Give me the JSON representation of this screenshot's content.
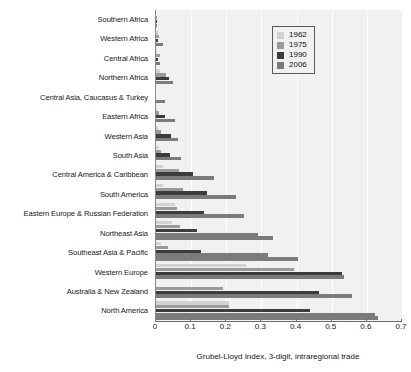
{
  "chart_data": {
    "type": "bar",
    "orientation": "horizontal",
    "title": "",
    "xlabel": "Grubel-Lloyd Index, 3-digit, intraregional trade",
    "ylabel": "",
    "xlim": [
      0,
      0.7
    ],
    "xticks": [
      0,
      0.1,
      0.2,
      0.3,
      0.4,
      0.5,
      0.6,
      0.7
    ],
    "xtick_labels": [
      "0",
      "0.1",
      "0.2",
      "0.3",
      "0.4",
      "0.5",
      "0.6",
      "0.7"
    ],
    "grid": true,
    "grid_axis": "x",
    "legend_position": "top-right",
    "categories": [
      "Southern Africa",
      "Western Africa",
      "Central Africa",
      "Northern Africa",
      "Central Asia, Caucasus & Turkey",
      "Eastern Africa",
      "Western Asia",
      "South Asia",
      "Central America & Caribbean",
      "South America",
      "Eastern Europe & Russian Federation",
      "Northeast Asia",
      "Southeast Asia & Pacific",
      "Western Europe",
      "Australia & New Zealand",
      "North America"
    ],
    "series": [
      {
        "name": "1962",
        "color": "#d2d2d2",
        "values": [
          0.0,
          0.007,
          0.004,
          0.012,
          0.0,
          0.002,
          0.006,
          0.008,
          0.021,
          0.02,
          0.055,
          0.045,
          0.015,
          0.256,
          0.0,
          0.208
        ]
      },
      {
        "name": "1975",
        "color": "#9a9a9a",
        "values": [
          0.002,
          0.009,
          0.01,
          0.028,
          0.0,
          0.008,
          0.013,
          0.014,
          0.065,
          0.077,
          0.06,
          0.068,
          0.033,
          0.392,
          0.19,
          0.207
        ]
      },
      {
        "name": "1990",
        "color": "#3c3c3c",
        "values": [
          0.002,
          0.005,
          0.005,
          0.037,
          0.0,
          0.025,
          0.042,
          0.04,
          0.105,
          0.145,
          0.137,
          0.116,
          0.128,
          0.529,
          0.463,
          0.438
        ]
      },
      {
        "name": "2006",
        "color": "#7b7b7b",
        "values": [
          0.002,
          0.021,
          0.012,
          0.049,
          0.026,
          0.053,
          0.062,
          0.072,
          0.165,
          0.227,
          0.249,
          0.29,
          0.318,
          0.536,
          0.558,
          0.622
        ]
      }
    ],
    "extra_bars": [
      {
        "category": "Northeast Asia",
        "series": "2006b",
        "value": 0.334,
        "color": "#7b7b7b"
      },
      {
        "category": "Southeast Asia & Pacific",
        "series": "2006b",
        "value": 0.404,
        "color": "#7b7b7b"
      },
      {
        "category": "North America",
        "series": "2006b",
        "value": 0.632,
        "color": "#7b7b7b"
      }
    ]
  },
  "legend": {
    "items": [
      {
        "label": "1962",
        "color": "#d2d2d2"
      },
      {
        "label": "1975",
        "color": "#9a9a9a"
      },
      {
        "label": "1990",
        "color": "#3c3c3c"
      },
      {
        "label": "2006",
        "color": "#7b7b7b"
      }
    ]
  }
}
